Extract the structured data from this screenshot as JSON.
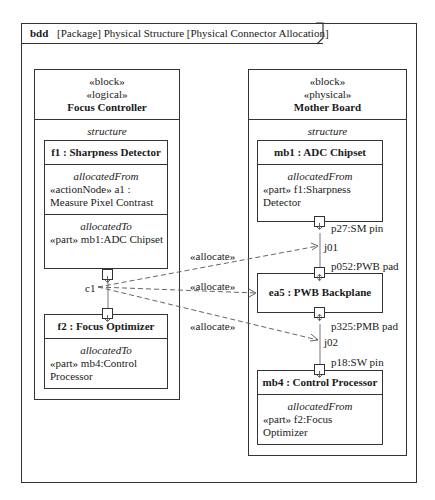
{
  "diagram": {
    "kind": "bdd",
    "header": "[Package] Physical Structure [Physical Connector Allocation]"
  },
  "left_block": {
    "stereotype1": "«block»",
    "stereotype2": "«logical»",
    "name": "Focus Controller",
    "compartment": "structure",
    "parts": [
      {
        "name": "f1 : Sharpness Detector",
        "sections": [
          {
            "title": "allocatedFrom",
            "lines": [
              "«actionNode» a1 :",
              "Measure Pixel Contrast"
            ]
          },
          {
            "title": "allocatedTo",
            "lines": [
              "«part» mb1:ADC Chipset"
            ]
          }
        ]
      },
      {
        "name": "f2 : Focus Optimizer",
        "sections": [
          {
            "title": "allocatedTo",
            "lines": [
              "«part» mb4:Control",
              "Processor"
            ]
          }
        ]
      }
    ],
    "connector": "c1"
  },
  "right_block": {
    "stereotype1": "«block»",
    "stereotype2": "«physical»",
    "name": "Mother Board",
    "compartment": "structure",
    "parts": [
      {
        "name": "mb1 : ADC Chipset",
        "sections": [
          {
            "title": "allocatedFrom",
            "lines": [
              "«part» f1:Sharpness",
              "Detector"
            ]
          }
        ]
      },
      {
        "name": "ea5 : PWB Backplane"
      },
      {
        "name": "mb4 : Control Processor",
        "sections": [
          {
            "title": "allocatedFrom",
            "lines": [
              "«part» f2:Focus",
              "Optimizer"
            ]
          }
        ]
      }
    ],
    "ports": [
      "p27:SM pin",
      "p052:PWB pad",
      "p325:PMB pad",
      "p18:SW pin"
    ],
    "connectors": [
      "j01",
      "j02"
    ]
  },
  "allocations": [
    "«allocate»",
    "«allocate»",
    "«allocate»"
  ]
}
